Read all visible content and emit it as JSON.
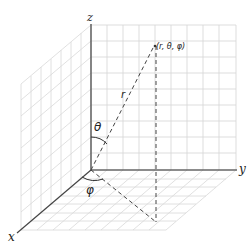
{
  "diagram": {
    "axes": {
      "x_label": "x",
      "y_label": "y",
      "z_label": "z"
    },
    "point": {
      "label": "(r, θ,  φ)"
    },
    "radius_label": "r",
    "polar_angle_label": "θ",
    "azimuth_angle_label": "φ",
    "colors": {
      "grid": "#d4d4d4",
      "axis": "#555555",
      "dashed": "#444444",
      "text": "#222222",
      "background": "#ffffff"
    }
  }
}
